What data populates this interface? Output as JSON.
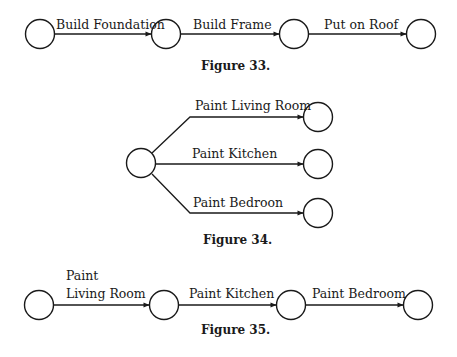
{
  "colors": {
    "ink": "#1a1a1a",
    "background": "#ffffff"
  },
  "figure33": {
    "caption": "Figure 33.",
    "edges": [
      {
        "label": "Build Foundation"
      },
      {
        "label": "Build Frame"
      },
      {
        "label": "Put on Roof"
      }
    ]
  },
  "figure34": {
    "caption": "Figure 34.",
    "edges": [
      {
        "label": "Paint Living Room"
      },
      {
        "label": "Paint Kitchen"
      },
      {
        "label": "Paint Bedroon"
      }
    ]
  },
  "figure35": {
    "caption": "Figure 35.",
    "edges": [
      {
        "label_line1": "Paint",
        "label_line2": "Living Room"
      },
      {
        "label": "Paint Kitchen"
      },
      {
        "label": "Paint Bedroom"
      }
    ]
  }
}
